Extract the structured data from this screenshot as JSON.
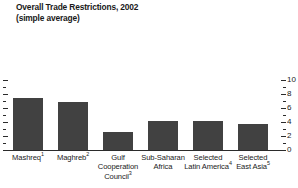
{
  "chart_data": {
    "type": "bar",
    "title": "Overall Trade Restrictions, 2002",
    "subtitle": "(simple average)",
    "xlabel": "",
    "ylabel": "",
    "ylim": [
      0,
      10
    ],
    "yticks": [
      0,
      2,
      4,
      6,
      8,
      10
    ],
    "ytick_labels": [
      "0",
      "2",
      "4",
      "6",
      "8",
      "10"
    ],
    "minor_yticks": [
      1,
      3,
      5,
      7,
      9
    ],
    "axis_position": "right",
    "grid": false,
    "legend": false,
    "bar_color": "#414141",
    "categories": [
      "Mashreq",
      "Maghreb",
      "Gulf Cooperation Council",
      "Sub-Saharan Africa",
      "Selected Latin America",
      "Selected East Asia"
    ],
    "category_footnotes": [
      "1",
      "2",
      "3",
      "",
      "4",
      "5"
    ],
    "values": [
      7.5,
      6.8,
      2.6,
      4.1,
      4.2,
      3.7
    ]
  },
  "axis": {
    "tick_labels": [
      "10",
      "8",
      "6",
      "4",
      "2",
      "0"
    ]
  },
  "categories": [
    {
      "line1": "Mashreq",
      "line2": "",
      "line3": "",
      "sup": "1"
    },
    {
      "line1": "Maghreb",
      "line2": "",
      "line3": "",
      "sup": "2"
    },
    {
      "line1": "Gulf",
      "line2": "Cooperation",
      "line3": "Council",
      "sup": "3"
    },
    {
      "line1": "Sub-Saharan",
      "line2": "Africa",
      "line3": "",
      "sup": ""
    },
    {
      "line1": "Selected",
      "line2": "Latin America",
      "line3": "",
      "sup": "4"
    },
    {
      "line1": "Selected",
      "line2": "East Asia",
      "line3": "",
      "sup": "5"
    }
  ]
}
